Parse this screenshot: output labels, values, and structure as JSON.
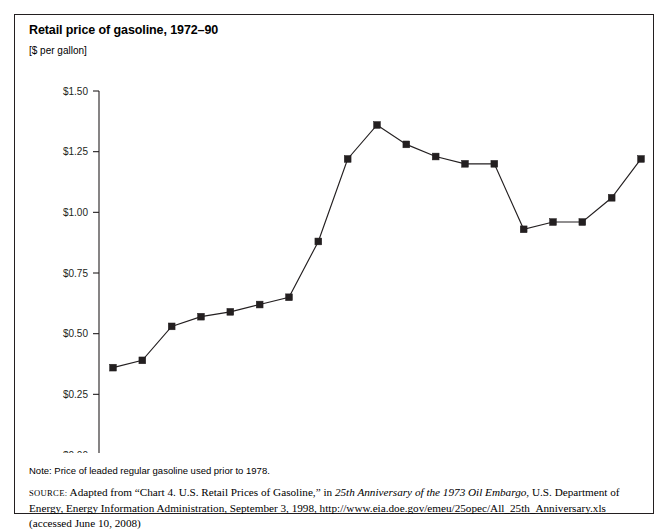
{
  "figure": {
    "title": "Retail price of gasoline, 1972–90",
    "units": "[$ per gallon]",
    "note": "Note: Price of leaded regular gasoline used prior to 1978.",
    "source_label": "SOURCE:",
    "source_part1": " Adapted from “Chart 4. U.S. Retail Prices of Gasoline,” in ",
    "source_italic": "25th Anniversary of the 1973 Oil Embargo",
    "source_part2": ", U.S. Department of Energy, Energy Information Administration, September 3, 1998, http://www.eia.doe.gov/emeu/25opec/All_25th_Anniversary.xls (accessed June 10, 2008)"
  },
  "colors": {
    "ink": "#231f20",
    "background": "#ffffff",
    "series": "#231f20"
  },
  "chart_data": {
    "type": "line",
    "title": "Retail price of gasoline, 1972–90",
    "subtitle": "[$ per gallon]",
    "xlabel": "",
    "ylabel": "[$ per gallon]",
    "x": [
      1972,
      1973,
      1974,
      1975,
      1976,
      1977,
      1978,
      1979,
      1980,
      1981,
      1982,
      1983,
      1984,
      1985,
      1986,
      1987,
      1988,
      1989,
      1990
    ],
    "values": [
      0.36,
      0.39,
      0.53,
      0.57,
      0.59,
      0.62,
      0.65,
      0.88,
      1.22,
      1.36,
      1.28,
      1.23,
      1.2,
      1.2,
      0.93,
      0.96,
      0.96,
      1.06,
      1.22
    ],
    "categories": [
      "1972",
      "1973",
      "1974",
      "1975",
      "1976",
      "1977",
      "1978",
      "1979",
      "1980",
      "1981",
      "1982",
      "1983",
      "1984",
      "1985",
      "1986",
      "1987",
      "1988",
      "1989",
      "1990"
    ],
    "xtick_labels": [
      "1972",
      "1973",
      "1974",
      "1975",
      "1976",
      "1977",
      "1978",
      "1979",
      "1980",
      "1981",
      "1982",
      "1983",
      "1984",
      "1985",
      "1986",
      "1987",
      "1988",
      "1989",
      "1990"
    ],
    "ytick_labels": [
      "$0.00",
      "$0.25",
      "$0.50",
      "$0.75",
      "$1.00",
      "$1.25",
      "$1.50"
    ],
    "ytick_values": [
      0.0,
      0.25,
      0.5,
      0.75,
      1.0,
      1.25,
      1.5
    ],
    "ylim": [
      0.0,
      1.5
    ],
    "xlim": [
      1972,
      1990
    ],
    "grid": false,
    "legend": false,
    "marker": "square",
    "series": [
      {
        "name": "Retail price of gasoline",
        "values": [
          0.36,
          0.39,
          0.53,
          0.57,
          0.59,
          0.62,
          0.65,
          0.88,
          1.22,
          1.36,
          1.28,
          1.23,
          1.2,
          1.2,
          0.93,
          0.96,
          0.96,
          1.06,
          1.22
        ]
      }
    ]
  }
}
